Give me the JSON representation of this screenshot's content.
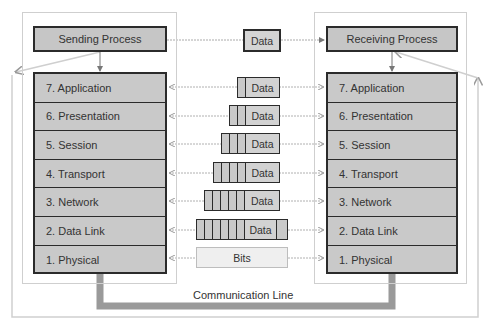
{
  "diagram": {
    "sender": {
      "title": "Sending Process"
    },
    "receiver": {
      "title": "Receiving Process"
    },
    "top_message": "Data",
    "layers": [
      {
        "label": "7. Application",
        "headers": 1,
        "trailer": false
      },
      {
        "label": "6. Presentation",
        "headers": 2,
        "trailer": false
      },
      {
        "label": "5. Session",
        "headers": 3,
        "trailer": false
      },
      {
        "label": "4. Transport",
        "headers": 4,
        "trailer": false
      },
      {
        "label": "3. Network",
        "headers": 5,
        "trailer": false
      },
      {
        "label": "2. Data Link",
        "headers": 6,
        "trailer": true
      },
      {
        "label": "1. Physical",
        "headers": 0,
        "trailer": false
      }
    ],
    "pdu_label": "Data",
    "physical_label": "Bits",
    "line_label": "Communication Line",
    "colors": {
      "box_fill": "#c9c9c9",
      "border": "#2b2b2b",
      "frame": "#cfcfcf",
      "comm_line": "#9a9a9a"
    }
  }
}
